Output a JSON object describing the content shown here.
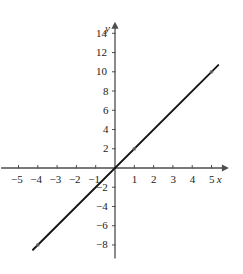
{
  "chart_data": {
    "type": "line",
    "title": "",
    "xlabel": "x",
    "ylabel": "y",
    "equation": "y = 2x",
    "slope": 2,
    "intercept": 0,
    "xlim": [
      -5.9,
      5.9
    ],
    "ylim": [
      -9.4,
      15.2
    ],
    "grid": false,
    "legend": "none",
    "axis_arrows": true,
    "x_ticks": [
      -5,
      -4,
      -3,
      -2,
      -1,
      1,
      2,
      3,
      4,
      5
    ],
    "x_tick_labels": [
      "−5",
      "−4",
      "−3",
      "−2",
      "−1",
      "1",
      "2",
      "3",
      "4",
      "5"
    ],
    "y_ticks": [
      -8,
      -6,
      -4,
      -2,
      2,
      4,
      6,
      8,
      10,
      12,
      14
    ],
    "y_tick_labels": [
      "−8",
      "−6",
      "−4",
      "−2",
      "2",
      "4",
      "6",
      "8",
      "10",
      "12",
      "14"
    ],
    "series": [
      {
        "name": "y = 2x",
        "color": "#151515",
        "x": [
          -4.25,
          5.35
        ],
        "y": [
          -8.5,
          10.7
        ],
        "points": [
          {
            "x": -4,
            "y": -8
          },
          {
            "x": 1,
            "y": 2
          },
          {
            "x": 5,
            "y": 10
          }
        ]
      }
    ],
    "colors": {
      "axis": "#4d4d4d",
      "line": "#151515",
      "text": "#1a1a1a",
      "background": "#ffffff",
      "marker": "#6b6b6b"
    }
  }
}
